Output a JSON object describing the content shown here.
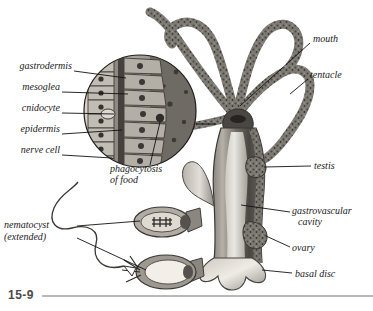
{
  "figure": {
    "number": "15-9",
    "organism": "hydra"
  },
  "labels_left": [
    {
      "name": "gastrodermis",
      "text": "gastrodermis",
      "x": 4,
      "y": 66,
      "line": [
        74,
        71,
        126,
        78
      ]
    },
    {
      "name": "mesoglea",
      "text": "mesoglea",
      "x": 4,
      "y": 87,
      "line": [
        62,
        92,
        128,
        94
      ]
    },
    {
      "name": "cnidocyte",
      "text": "cnidocyte",
      "x": 4,
      "y": 108,
      "line": [
        62,
        113,
        120,
        114
      ]
    },
    {
      "name": "epidermis",
      "text": "epidermis",
      "x": 4,
      "y": 129,
      "line": [
        62,
        134,
        122,
        130
      ]
    },
    {
      "name": "nerve-cell",
      "text": "nerve cell",
      "x": 4,
      "y": 150,
      "line": [
        62,
        155,
        126,
        148
      ]
    }
  ],
  "labels_callout": [
    {
      "name": "phagocytosis-of-food",
      "lines": [
        "phagocytosis",
        "of food"
      ],
      "x": 110,
      "y": 168,
      "line": [
        150,
        167,
        165,
        126
      ]
    },
    {
      "name": "nematocyst-extended",
      "lines": [
        "nematocyst",
        "(extended)"
      ],
      "x": 4,
      "y": 223,
      "line1": [
        77,
        228,
        140,
        222
      ],
      "line2": [
        77,
        240,
        148,
        272
      ]
    }
  ],
  "labels_right": [
    {
      "name": "mouth",
      "text": "mouth",
      "x": 312,
      "y": 38,
      "line": [
        310,
        43,
        238,
        103
      ]
    },
    {
      "name": "tentacle",
      "text": "tentacle",
      "x": 310,
      "y": 74,
      "line": [
        308,
        79,
        288,
        96
      ]
    },
    {
      "name": "testis",
      "text": "testis",
      "x": 313,
      "y": 164,
      "line": [
        311,
        168,
        252,
        168
      ]
    },
    {
      "name": "gastrovascular-cavity",
      "lines": [
        "gastrovascular",
        "cavity"
      ],
      "x": 292,
      "y": 210,
      "line": [
        290,
        214,
        242,
        207
      ]
    },
    {
      "name": "ovary",
      "text": "ovary",
      "x": 292,
      "y": 247,
      "line": [
        290,
        250,
        262,
        238
      ]
    },
    {
      "name": "basal-disc",
      "text": "basal disc",
      "x": 294,
      "y": 272,
      "line": [
        292,
        276,
        262,
        272
      ]
    }
  ],
  "inset": {
    "name": "body-wall-magnification",
    "shape": "circle",
    "center_x": 140,
    "center_y": 111,
    "radius": 56
  },
  "nematocysts": [
    {
      "name": "nematocyst-undischarged",
      "center_x": 162,
      "center_y": 222
    },
    {
      "name": "nematocyst-discharged",
      "center_x": 165,
      "center_y": 272
    }
  ],
  "colors": {
    "background": "#ffffff",
    "ink": "#1a1a1a",
    "rule": "#b9b9b9",
    "fignum": "#4a4a4a",
    "tissue_dark": "#4c4a47",
    "tissue_mid": "#87837d",
    "tissue_light": "#c9c5bd",
    "cavity": "#e8e5df"
  }
}
